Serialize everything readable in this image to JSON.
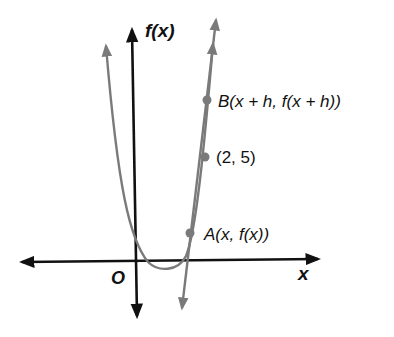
{
  "diagram": {
    "type": "graph-secant-line",
    "axes": {
      "y_label": "f(x)",
      "x_label": "x",
      "origin_label": "O"
    },
    "points": [
      {
        "id": "B",
        "label": "B(x + h, f(x + h))",
        "px": [
          207,
          100
        ]
      },
      {
        "id": "P",
        "label": "(2, 5)",
        "px": [
          205,
          157
        ]
      },
      {
        "id": "A",
        "label": "A(x, f(x))",
        "px": [
          190,
          233
        ]
      }
    ],
    "curves": [
      {
        "name": "parabola f(x)",
        "color": "#7a7a7a"
      },
      {
        "name": "secant line AB",
        "color": "#7a7a7a"
      }
    ],
    "colors": {
      "axes": "#111111",
      "curve": "#7a7a7a",
      "point": "#7a7a7a",
      "text": "#111111",
      "background": "#ffffff"
    }
  }
}
